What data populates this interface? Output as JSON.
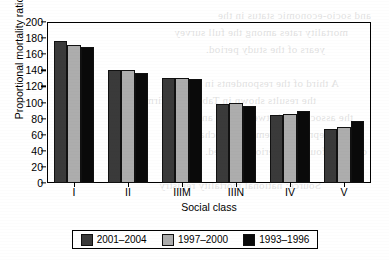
{
  "chart_data": {
    "type": "bar",
    "title": "",
    "xlabel": "Social class",
    "ylabel": "Proportional mortality ratio",
    "categories": [
      "I",
      "II",
      "IIIM",
      "IIIN",
      "IV",
      "V"
    ],
    "series": [
      {
        "name": "2001–2004",
        "color": "#3a3a3a",
        "values": [
          177,
          141,
          130,
          98,
          84,
          67
        ]
      },
      {
        "name": "1997–2000",
        "color": "#adadad",
        "values": [
          172,
          140,
          130,
          100,
          86,
          69
        ]
      },
      {
        "name": "1993–1996",
        "color": "#0a0a0a",
        "values": [
          169,
          137,
          129,
          96,
          90,
          77
        ]
      }
    ],
    "ylim": [
      0,
      200
    ],
    "yticks": [
      0,
      20,
      40,
      60,
      80,
      100,
      120,
      140,
      160,
      180,
      200
    ],
    "ytick_labels": [
      "0",
      "20",
      "40",
      "60",
      "80",
      "100",
      "120",
      "140",
      "160",
      "180",
      "200"
    ],
    "grid": false,
    "legend_position": "bottom"
  },
  "legend": {
    "items": [
      {
        "label": "2001–2004",
        "swatch": "dark-gray-swatch"
      },
      {
        "label": "1997–2000",
        "swatch": "light-gray-swatch"
      },
      {
        "label": "1993–1996",
        "swatch": "black-swatch"
      }
    ]
  },
  "bleed_through": {
    "lines": [
      "and socio-economic status in the",
      "mortality rates among the full survey",
      "years of the study period.",
      "",
      "A third of the respondents in the",
      "the results shown in Table 2 confirm",
      "the association between class and",
      "deprivation remained unchanged",
      "over the four time periods studied.",
      "",
      "Source: national mortality registry"
    ]
  }
}
